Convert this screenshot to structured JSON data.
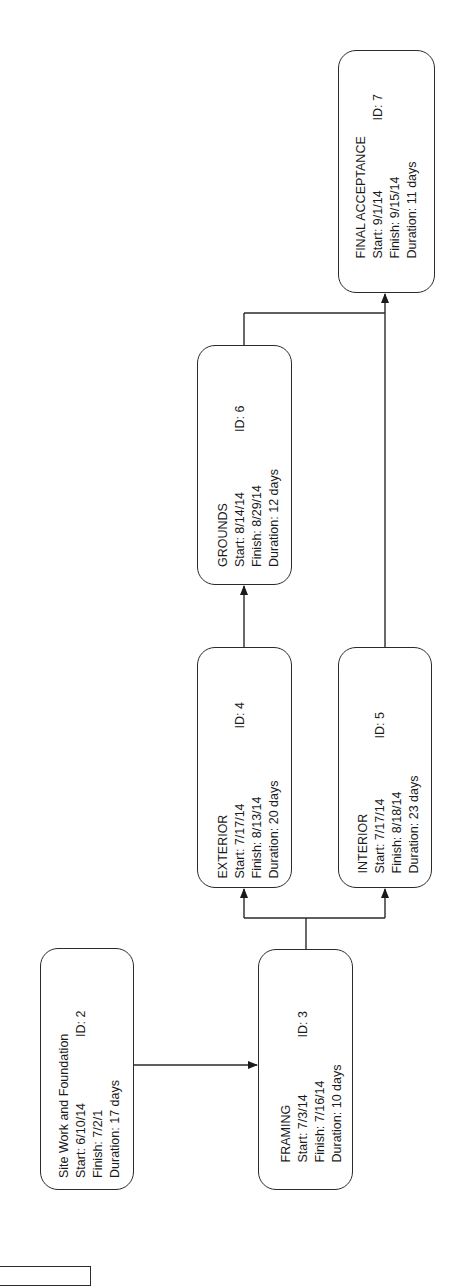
{
  "diagram": {
    "type": "project network diagram (rotated)",
    "nodes": [
      {
        "key": "site",
        "name": "Site Work and Foundation",
        "id_label": "ID: 2",
        "start": "Start:  6/10/14",
        "finish": "Finish:  7/2/1",
        "duration": "Duration: 17 days",
        "box": {
          "x": 40,
          "y": 948,
          "w": 94,
          "h": 242
        },
        "pad_left": 12,
        "pad_top": 16,
        "id_offset": 141
      },
      {
        "key": "framing",
        "name": "FRAMING",
        "id_label": "ID: 3",
        "start": "Start:  7/3/14",
        "finish": "Finish:  7/16/14",
        "duration": "Duration: 10 days",
        "box": {
          "x": 258,
          "y": 949,
          "w": 95,
          "h": 241
        },
        "pad_left": 28,
        "pad_top": 19,
        "id_offset": 125
      },
      {
        "key": "exterior",
        "name": "EXTERIOR",
        "id_label": "ID: 4",
        "start": "Start:  7/17/14",
        "finish": "Finish:  8/13/14",
        "duration": "Duration: 20 days",
        "box": {
          "x": 197,
          "y": 647,
          "w": 95,
          "h": 241
        },
        "pad_left": 10,
        "pad_top": 17,
        "id_offset": 150
      },
      {
        "key": "interior",
        "name": "INTERIOR",
        "id_label": "ID: 5",
        "start": "Start:  7/17/14",
        "finish": "Finish:  8/18/14",
        "duration": "Duration: 23 days",
        "box": {
          "x": 338,
          "y": 647,
          "w": 94,
          "h": 241
        },
        "pad_left": 15,
        "pad_top": 17,
        "id_offset": 135
      },
      {
        "key": "grounds",
        "name": "GROUNDS",
        "id_label": "ID: 6",
        "start": "Start:  8/14/14",
        "finish": "Finish:  8/29/14",
        "duration": "Duration: 12 days",
        "box": {
          "x": 197,
          "y": 345,
          "w": 95,
          "h": 240
        },
        "pad_left": 18,
        "pad_top": 17,
        "id_offset": 135
      },
      {
        "key": "final",
        "name": "FINAL ACCEPTANCE",
        "id_label": "ID: 7",
        "start": "Start:  9/1/14",
        "finish": "Finish:  9/15/14",
        "duration": "Duration: 11 days",
        "box": {
          "x": 338,
          "y": 50,
          "w": 97,
          "h": 243
        },
        "pad_left": 35,
        "pad_top": 14,
        "id_offset": 138
      }
    ],
    "edges": [
      {
        "from": "Site Work and Foundation",
        "to": "FRAMING"
      },
      {
        "from": "FRAMING",
        "to": "EXTERIOR"
      },
      {
        "from": "FRAMING",
        "to": "INTERIOR"
      },
      {
        "from": "EXTERIOR",
        "to": "GROUNDS"
      },
      {
        "from": "GROUNDS",
        "to": "FINAL ACCEPTANCE"
      },
      {
        "from": "INTERIOR",
        "to": "FINAL ACCEPTANCE"
      }
    ],
    "colors": {
      "stroke": "#2a2a2a",
      "background": "#ffffff",
      "text": "#1a1a1a"
    }
  }
}
